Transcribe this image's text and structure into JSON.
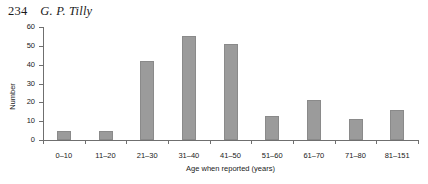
{
  "header": {
    "folio": "234",
    "author": "G. P. Tilly"
  },
  "chart_data": {
    "type": "bar",
    "title": "",
    "xlabel": "Age when reported (years)",
    "ylabel": "Number",
    "categories": [
      "0–10",
      "11–20",
      "21–30",
      "31–40",
      "41–50",
      "51–60",
      "61–70",
      "71–80",
      "81–151"
    ],
    "values": [
      5,
      5,
      42,
      55,
      51,
      13,
      21,
      11,
      16
    ],
    "ylim": [
      0,
      60
    ],
    "yticks": [
      0,
      10,
      20,
      30,
      40,
      50,
      60
    ],
    "ytick_labels": [
      "0",
      "10",
      "20",
      "30",
      "40",
      "50",
      "60"
    ],
    "grid": false,
    "legend": "none",
    "bar_color": "#9b9b9b",
    "bar_edge_color": "#8a8a8a",
    "axis_color": "#6f6f6f"
  }
}
